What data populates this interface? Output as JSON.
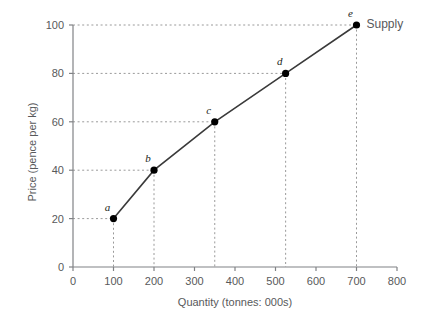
{
  "chart_data": {
    "type": "line",
    "title": "",
    "xlabel": "Quantity (tonnes: 000s)",
    "ylabel": "Price (pence per kg)",
    "xlim": [
      0,
      800
    ],
    "ylim": [
      0,
      100
    ],
    "xticks": [
      0,
      100,
      200,
      300,
      400,
      500,
      600,
      700,
      800
    ],
    "xticklabels": [
      "0",
      "100",
      "200",
      "300",
      "400",
      "500",
      "600",
      "700",
      "800"
    ],
    "yticks": [
      0,
      20,
      40,
      60,
      80,
      100
    ],
    "yticklabels": [
      "0",
      "20",
      "40",
      "60",
      "80",
      "100"
    ],
    "grid": false,
    "legend_position": "inline-right-of-last-point",
    "series": [
      {
        "name": "Supply",
        "label": "Supply",
        "color": "#3a3a3a",
        "marker": "filled-circle",
        "marker_color": "#000000",
        "points": [
          {
            "label": "a",
            "x": 100,
            "y": 20
          },
          {
            "label": "b",
            "x": 200,
            "y": 40
          },
          {
            "label": "c",
            "x": 350,
            "y": 60
          },
          {
            "label": "d",
            "x": 525,
            "y": 80
          },
          {
            "label": "e",
            "x": 700,
            "y": 100
          }
        ]
      }
    ],
    "annotations": [
      {
        "name": "guideline",
        "from": "a",
        "to": "both-axes",
        "style": "dashed"
      },
      {
        "name": "guideline",
        "from": "b",
        "to": "both-axes",
        "style": "dashed"
      },
      {
        "name": "guideline",
        "from": "c",
        "to": "both-axes",
        "style": "dashed"
      },
      {
        "name": "guideline",
        "from": "d",
        "to": "both-axes",
        "style": "dashed"
      },
      {
        "name": "guideline",
        "from": "e",
        "to": "both-axes",
        "style": "dashed"
      }
    ],
    "colors": {
      "axis": "#808285",
      "gridline": "#9a9a9a",
      "series": "#3a3a3a",
      "marker": "#000000",
      "tick_text": "#58595b",
      "point_text": "#231f20",
      "background": "#ffffff"
    }
  }
}
